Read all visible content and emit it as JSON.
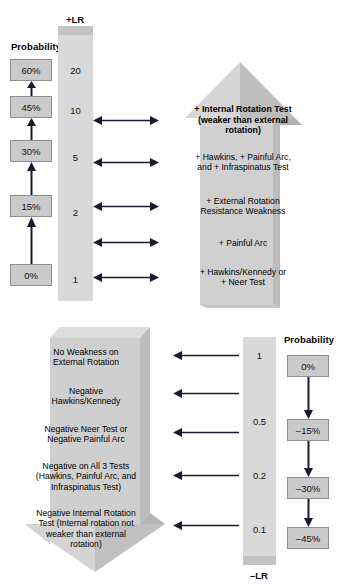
{
  "figure": {
    "type": "likelihood-ratio-nomogram",
    "title_fragment": "",
    "colors": {
      "bar_fill": "#d9d9d9",
      "bar_cap": "#c3c3c3",
      "box_fill": "#cacaca",
      "box_border": "#8e8e8e",
      "block_light": "#d6d6d6",
      "block_mid": "#c6c6c6",
      "block_dark": "#b6b6b6",
      "arrow_stroke": "#1a1a2e",
      "text": "#000000"
    }
  },
  "upper": {
    "probability_heading": "Probability",
    "lr_label": "+LR",
    "lr_ticks": [
      "20",
      "10",
      "5",
      "2",
      "1"
    ],
    "probability_boxes": [
      "60%",
      "45%",
      "30%",
      "15%",
      "0%"
    ],
    "test_labels": [
      "+ Internal Rotation Test\n(weaker than external\nrotation)",
      "+ Hawkins, + Painful Arc,\nand + Infraspinatus Test",
      "+ External Rotation\nResistance Weakness",
      "+ Painful Arc",
      "+ Hawkins/Kennedy or\n+ Neer Test"
    ],
    "arrow_direction": "up"
  },
  "lower": {
    "probability_heading": "Probability",
    "lr_label": "–LR",
    "lr_ticks": [
      "1",
      "0.5",
      "0.2",
      "0.1"
    ],
    "probability_boxes": [
      "0%",
      "–15%",
      "–30%",
      "–45%"
    ],
    "test_labels": [
      "No Weakness on\nExternal Rotation",
      "Negative\nHawkins/Kennedy",
      "Negative Neer Test or\nNegative Painful Arc",
      "Negative on All 3 Tests\n(Hawkins, Painful Arc, and\nInfraspinatus Test)",
      "Negative Internal Rotation\nTest (Internal rotation not\nweaker than external\nrotation)"
    ],
    "arrow_direction": "down"
  }
}
